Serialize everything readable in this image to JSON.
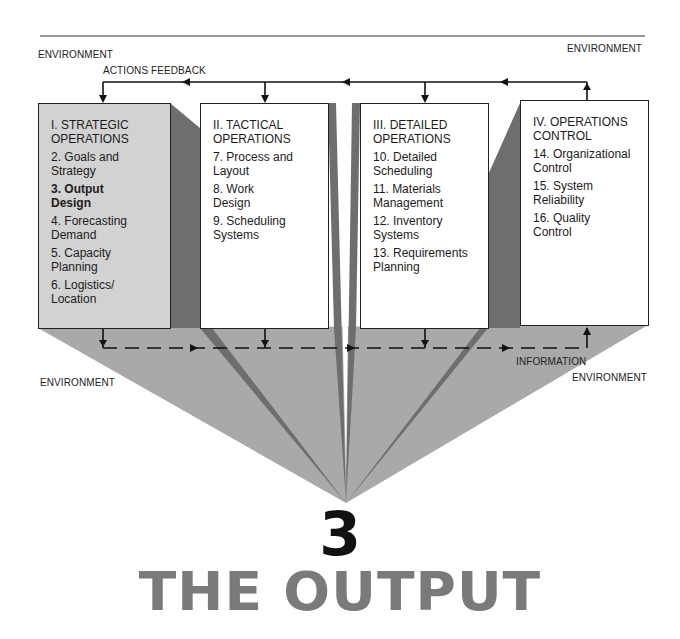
{
  "labels": {
    "environment_top_left": "ENVIRONMENT",
    "environment_top_right": "ENVIRONMENT",
    "environment_bottom_left": "ENVIRONMENT",
    "environment_bottom_right": "ENVIRONMENT",
    "actions_feedback": "ACTIONS FEEDBACK",
    "information": "INFORMATION"
  },
  "boxes": [
    {
      "title": [
        "I. STRATEGIC",
        "OPERATIONS"
      ],
      "items": [
        {
          "text": [
            "2. Goals and",
            "Strategy"
          ],
          "bold": false
        },
        {
          "text": [
            "3. Output",
            "Design"
          ],
          "bold": true
        },
        {
          "text": [
            "4. Forecasting",
            "Demand"
          ],
          "bold": false
        },
        {
          "text": [
            "5. Capacity",
            "Planning"
          ],
          "bold": false
        },
        {
          "text": [
            "6. Logistics/",
            "Location"
          ],
          "bold": false
        }
      ]
    },
    {
      "title": [
        "II. TACTICAL",
        "OPERATIONS"
      ],
      "items": [
        {
          "text": [
            "7. Process and",
            "Layout"
          ],
          "bold": false
        },
        {
          "text": [
            "8. Work",
            "Design"
          ],
          "bold": false
        },
        {
          "text": [
            "9. Scheduling",
            "Systems"
          ],
          "bold": false
        }
      ]
    },
    {
      "title": [
        "III. DETAILED",
        "OPERATIONS"
      ],
      "items": [
        {
          "text": [
            "10. Detailed",
            "Scheduling"
          ],
          "bold": false
        },
        {
          "text": [
            "11. Materials",
            "Management"
          ],
          "bold": false
        },
        {
          "text": [
            "12. Inventory",
            "Systems"
          ],
          "bold": false
        },
        {
          "text": [
            "13. Requirements",
            "Planning"
          ],
          "bold": false
        }
      ]
    },
    {
      "title": [
        "IV. OPERATIONS",
        "CONTROL"
      ],
      "items": [
        {
          "text": [
            "14. Organizational",
            "Control"
          ],
          "bold": false
        },
        {
          "text": [
            "15. System",
            "Reliability"
          ],
          "bold": false
        },
        {
          "text": [
            "16. Quality",
            "Control"
          ],
          "bold": false
        }
      ]
    }
  ],
  "chapter": {
    "number": "3",
    "title": "THE OUTPUT"
  },
  "colors": {
    "funnel_light": "#a9a9a9",
    "funnel_dark": "#6e6e6e",
    "box_strategic": "#d2d2d2",
    "box_other": "#ffffff",
    "chapter_number": "#111111",
    "chapter_title": "#7a7a7a"
  }
}
